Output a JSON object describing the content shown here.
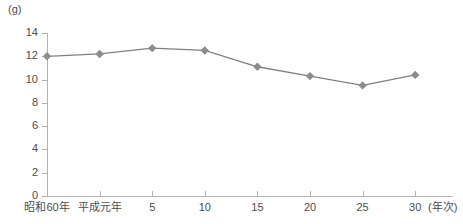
{
  "chart_data": {
    "type": "line",
    "title": "",
    "subtitle": "",
    "unit_label": "(g)",
    "xlabel": "(年次)",
    "ylabel": "",
    "categories": [
      "昭和60年",
      "平成元年",
      "5",
      "10",
      "15",
      "20",
      "25",
      "30"
    ],
    "values": [
      12.0,
      12.2,
      12.7,
      12.5,
      11.1,
      10.3,
      9.5,
      10.4
    ],
    "series": [
      {
        "name": "",
        "values": [
          12.0,
          12.2,
          12.7,
          12.5,
          11.1,
          10.3,
          9.5,
          10.4
        ]
      }
    ],
    "ylim": [
      0,
      14
    ],
    "y_ticks": [
      0,
      2,
      4,
      6,
      8,
      10,
      12,
      14
    ],
    "y_tick_labels": [
      "0",
      "2",
      "4",
      "6",
      "8",
      "10",
      "12",
      "14"
    ],
    "grid": false,
    "legend": "none",
    "marker": "diamond",
    "colors": {
      "line": "#808080",
      "marker": "#8c8c8c",
      "axis": "#b3b3b3",
      "text": "#4d4d4d",
      "background": "#ffffff"
    }
  }
}
